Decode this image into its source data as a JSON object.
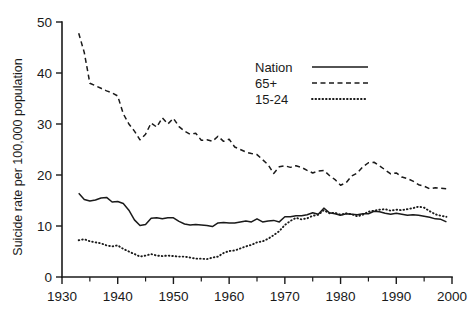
{
  "chart_data": {
    "type": "line",
    "title": "",
    "xlabel": "",
    "ylabel": "Suicide rate per 100,000 population",
    "xlim": [
      1930,
      2000
    ],
    "ylim": [
      0,
      50
    ],
    "grid": false,
    "legend_position": "upper-right-inside",
    "x_ticks": [
      1930,
      1940,
      1950,
      1960,
      1970,
      1980,
      1990,
      2000
    ],
    "x_tick_labels": [
      "1930",
      "1940",
      "1950",
      "1960",
      "1970",
      "1980",
      "1990",
      "2000"
    ],
    "x_minor_ticks": [
      1935,
      1945,
      1955,
      1965,
      1975,
      1985,
      1995
    ],
    "y_ticks": [
      0,
      10,
      20,
      30,
      40,
      50
    ],
    "y_tick_labels": [
      "0",
      "10",
      "20",
      "30",
      "40",
      "50"
    ],
    "x": [
      1933,
      1934,
      1935,
      1936,
      1937,
      1938,
      1939,
      1940,
      1941,
      1942,
      1943,
      1944,
      1945,
      1946,
      1947,
      1948,
      1949,
      1950,
      1951,
      1952,
      1953,
      1954,
      1955,
      1956,
      1957,
      1958,
      1959,
      1960,
      1961,
      1962,
      1963,
      1964,
      1965,
      1966,
      1967,
      1968,
      1969,
      1970,
      1971,
      1972,
      1973,
      1974,
      1975,
      1976,
      1977,
      1978,
      1979,
      1980,
      1981,
      1982,
      1983,
      1984,
      1985,
      1986,
      1987,
      1988,
      1989,
      1990,
      1991,
      1992,
      1993,
      1994,
      1995,
      1996,
      1997,
      1998,
      1999
    ],
    "series": [
      {
        "name": "Nation",
        "style": "solid",
        "values": [
          16.4,
          15.2,
          14.9,
          15.1,
          15.5,
          15.6,
          14.7,
          14.8,
          14.4,
          13.1,
          11.2,
          10.1,
          10.3,
          11.5,
          11.6,
          11.4,
          11.6,
          11.6,
          10.9,
          10.4,
          10.2,
          10.3,
          10.2,
          10.1,
          9.9,
          10.6,
          10.7,
          10.6,
          10.6,
          10.8,
          11.0,
          10.8,
          11.4,
          10.8,
          11.0,
          11.1,
          10.8,
          11.8,
          11.8,
          12.0,
          12.0,
          12.2,
          12.6,
          12.3,
          13.5,
          12.6,
          12.4,
          12.1,
          12.4,
          12.3,
          12.2,
          12.4,
          12.4,
          12.9,
          12.8,
          12.5,
          12.3,
          12.5,
          12.3,
          12.1,
          12.2,
          12.1,
          11.9,
          11.7,
          11.4,
          11.3,
          10.8
        ]
      },
      {
        "name": "65+",
        "style": "dashed",
        "values": [
          47.8,
          44.0,
          38.0,
          37.5,
          37.0,
          36.5,
          36.1,
          35.5,
          32.0,
          30.0,
          28.6,
          26.9,
          28.0,
          30.2,
          29.4,
          31.2,
          30.0,
          31.1,
          29.5,
          28.6,
          28.0,
          28.2,
          26.8,
          26.9,
          26.6,
          27.6,
          26.6,
          27.0,
          25.5,
          25.0,
          24.5,
          24.2,
          24.0,
          23.0,
          22.0,
          20.3,
          21.6,
          21.8,
          21.5,
          21.8,
          21.5,
          20.9,
          20.4,
          20.8,
          20.9,
          19.9,
          19.1,
          18.0,
          18.5,
          19.8,
          20.4,
          21.6,
          22.4,
          22.5,
          21.8,
          21.0,
          20.2,
          20.4,
          19.6,
          19.3,
          18.8,
          18.1,
          17.8,
          17.3,
          17.5,
          17.4,
          17.3
        ]
      },
      {
        "name": "15-24",
        "style": "dotted",
        "values": [
          7.2,
          7.4,
          7.0,
          6.8,
          6.6,
          6.2,
          6.0,
          6.2,
          5.5,
          5.0,
          4.5,
          4.0,
          4.2,
          4.5,
          4.2,
          4.1,
          4.2,
          4.1,
          4.0,
          4.0,
          3.8,
          3.6,
          3.6,
          3.5,
          3.8,
          4.0,
          4.7,
          5.1,
          5.2,
          5.6,
          6.0,
          6.3,
          6.8,
          7.0,
          7.5,
          8.2,
          9.0,
          10.2,
          11.0,
          11.6,
          11.3,
          11.5,
          12.0,
          12.2,
          13.1,
          12.5,
          12.6,
          12.2,
          12.5,
          12.3,
          11.9,
          12.2,
          12.8,
          13.0,
          13.2,
          13.3,
          13.0,
          13.2,
          13.1,
          13.3,
          13.5,
          13.8,
          13.6,
          12.9,
          12.3,
          12.0,
          11.8
        ]
      }
    ],
    "legend": [
      {
        "label": "Nation",
        "style": "solid"
      },
      {
        "label": "65+",
        "style": "dashed"
      },
      {
        "label": "15-24",
        "style": "dotted"
      }
    ],
    "accent_color": "#1a1a1a",
    "background_color": "#ffffff"
  }
}
